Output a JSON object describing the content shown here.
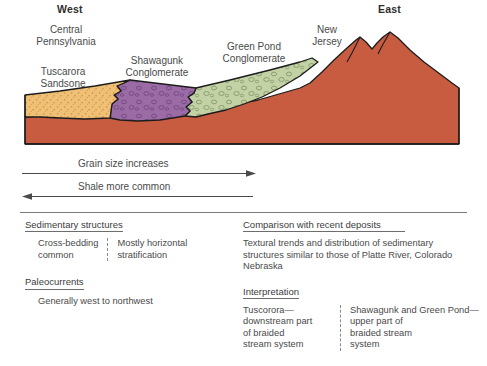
{
  "figure": {
    "title_region": "stratigraphic cross section",
    "directions": {
      "west": "West",
      "east": "East"
    },
    "unit_labels": {
      "central_pennsylvania": "Central\nPennsylvania",
      "tuscarora_sandstone": "Tuscarora\nSandsone",
      "shawangunk_conglomerate": "Shawagunk\nConglomerate",
      "green_pond_conglomerate": "Green Pond\nConglomerate",
      "new_jersey": "New\nJersey"
    },
    "colors": {
      "sandstone": "#efc077",
      "sandstone_stipple": "#d89a3f",
      "conglomerate_purple": "#9b6ba5",
      "conglomerate_purple_clast": "#7b4d88",
      "conglomerate_green": "#c3d2a5",
      "conglomerate_green_clast": "#8ea172",
      "basement_red": "#c75c41",
      "outline": "#1c1c1c",
      "text": "#4a4a4a",
      "rule": "#7a7a7a"
    }
  },
  "arrows": [
    {
      "id": "grain-size-arrow",
      "caption": "Grain size increases",
      "direction": "right"
    },
    {
      "id": "shale-common-arrow",
      "caption": "Shale more common",
      "direction": "left"
    }
  ],
  "panels": {
    "left": {
      "sections": [
        {
          "id": "sedimentary-structures",
          "heading": "Sedimentary structures",
          "columns": [
            "Cross-bedding\ncommon",
            "Mostly horizontal\nstratification"
          ]
        },
        {
          "id": "paleocurrents",
          "heading": "Paleocurrents",
          "text": "Generally west to northwest"
        }
      ]
    },
    "right": {
      "sections": [
        {
          "id": "comparison-recent-deposits",
          "heading": "Comparison with recent deposits",
          "text": "Textural trends and distribution of sedimentary\nstructures similar to those of Platte River, Colorado\nNebraska"
        },
        {
          "id": "interpretation",
          "heading": "Interpretation",
          "columns": [
            "Tuscorora—\ndownstream part\nof braided\nstream system",
            "Shawagunk and Green Pond—\nupper part of\nbraided stream\nsystem"
          ]
        }
      ]
    }
  }
}
